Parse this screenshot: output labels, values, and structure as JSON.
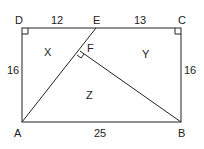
{
  "diagram": {
    "points": {
      "D": "D",
      "E": "E",
      "C": "C",
      "F": "F",
      "A": "A",
      "B": "B"
    },
    "segments": {
      "DE": "12",
      "EC": "13",
      "AD": "16",
      "BC": "16",
      "AB": "25"
    },
    "regions": {
      "X": "X",
      "Y": "Y",
      "Z": "Z"
    },
    "colors": {
      "line": "#222222",
      "background": "#ffffff"
    }
  }
}
